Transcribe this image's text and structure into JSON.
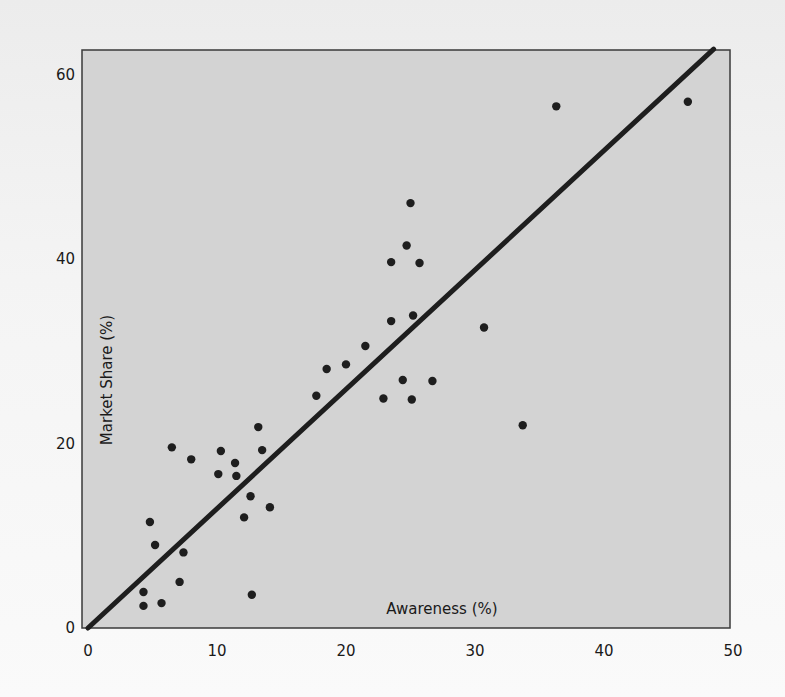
{
  "chart_data": {
    "type": "scatter",
    "title": "",
    "xlabel": "Awareness (%)",
    "ylabel": "Market Share (%)",
    "xlim": [
      0,
      50
    ],
    "ylim": [
      0,
      60
    ],
    "xticks": [
      0,
      10,
      20,
      30,
      40,
      50
    ],
    "yticks": [
      0,
      20,
      40,
      60
    ],
    "grid": false,
    "legend": null,
    "colors": {
      "plot_background": "#d3d3d3",
      "page_background": "#f2f2f2",
      "points": "#1e1e1e",
      "line": "#1e1e1e",
      "frame": "#3a3a3a"
    },
    "series": [
      {
        "name": "Brands",
        "kind": "points",
        "x": [
          4.3,
          4.3,
          5.7,
          7.1,
          4.8,
          5.2,
          7.4,
          12.7,
          12.6,
          14.1,
          12.1,
          6.5,
          8.0,
          10.3,
          11.4,
          10.1,
          11.5,
          13.2,
          13.5,
          17.7,
          18.5,
          20.0,
          21.5,
          22.9,
          24.4,
          25.1,
          26.7,
          23.5,
          25.2,
          23.5,
          24.7,
          25.7,
          25.0,
          30.7,
          33.7,
          36.3,
          46.5
        ],
        "y": [
          2.4,
          3.9,
          2.7,
          5.0,
          11.5,
          9.0,
          8.2,
          3.6,
          14.3,
          13.1,
          12.0,
          19.6,
          18.3,
          19.2,
          17.9,
          16.7,
          16.5,
          21.8,
          19.3,
          25.2,
          28.1,
          28.6,
          30.6,
          24.9,
          26.9,
          24.8,
          26.8,
          33.3,
          33.9,
          39.7,
          41.5,
          39.6,
          46.1,
          32.6,
          22.0,
          56.6,
          57.1
        ]
      },
      {
        "name": "Fit line",
        "kind": "line",
        "x": [
          0,
          48.5
        ],
        "y": [
          0,
          62.8
        ]
      }
    ]
  }
}
